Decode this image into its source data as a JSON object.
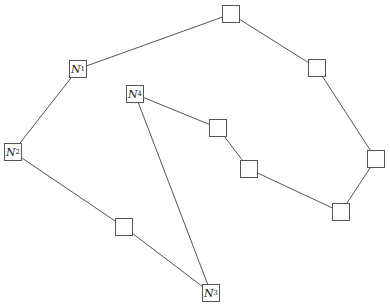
{
  "diagram": {
    "type": "graph",
    "colors": {
      "stroke": "#555555",
      "background": "#ffffff",
      "text": "#222222"
    },
    "nodes": [
      {
        "id": "N1",
        "letter": "N",
        "sub": "1",
        "x": 69,
        "y": 60,
        "w": 18,
        "h": 18
      },
      {
        "id": "N2",
        "letter": "N",
        "sub": "2",
        "x": 4,
        "y": 143,
        "w": 18,
        "h": 18
      },
      {
        "id": "N3",
        "letter": "N",
        "sub": "3",
        "x": 202,
        "y": 284,
        "w": 18,
        "h": 18
      },
      {
        "id": "N4",
        "letter": "N",
        "sub": "4",
        "x": 126,
        "y": 85,
        "w": 18,
        "h": 18
      },
      {
        "id": "A",
        "letter": "",
        "sub": "",
        "x": 222,
        "y": 5,
        "w": 18,
        "h": 18
      },
      {
        "id": "B",
        "letter": "",
        "sub": "",
        "x": 308,
        "y": 59,
        "w": 18,
        "h": 18
      },
      {
        "id": "C",
        "letter": "",
        "sub": "",
        "x": 367,
        "y": 150,
        "w": 18,
        "h": 18
      },
      {
        "id": "D",
        "letter": "",
        "sub": "",
        "x": 332,
        "y": 203,
        "w": 18,
        "h": 18
      },
      {
        "id": "E",
        "letter": "",
        "sub": "",
        "x": 209,
        "y": 119,
        "w": 18,
        "h": 18
      },
      {
        "id": "F",
        "letter": "",
        "sub": "",
        "x": 240,
        "y": 160,
        "w": 18,
        "h": 18
      },
      {
        "id": "G",
        "letter": "",
        "sub": "",
        "x": 115,
        "y": 218,
        "w": 18,
        "h": 18
      }
    ],
    "edges": [
      [
        "N1",
        "A"
      ],
      [
        "A",
        "B"
      ],
      [
        "B",
        "C"
      ],
      [
        "C",
        "D"
      ],
      [
        "D",
        "F"
      ],
      [
        "F",
        "E"
      ],
      [
        "E",
        "N4"
      ],
      [
        "N4",
        "N3"
      ],
      [
        "N1",
        "N2"
      ],
      [
        "N2",
        "G"
      ],
      [
        "G",
        "N3"
      ]
    ]
  }
}
